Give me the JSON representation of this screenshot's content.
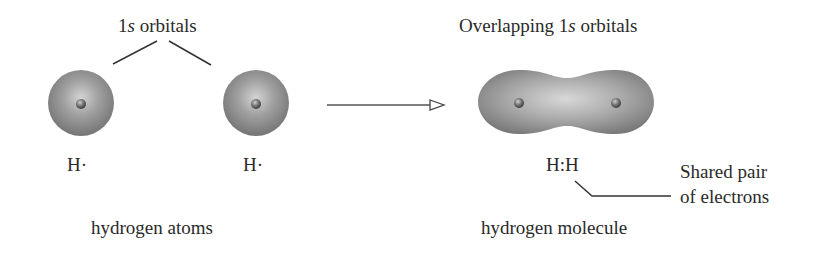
{
  "left_panel": {
    "orbital_label_prefix": "1",
    "orbital_label_italic": "s",
    "orbital_label_suffix": " orbitals",
    "atom_symbols": [
      "H·",
      "H·"
    ],
    "caption": "hydrogen atoms"
  },
  "right_panel": {
    "title_prefix": "Overlapping 1",
    "title_italic": "s",
    "title_suffix": " orbitals",
    "lewis_structure": "H:H",
    "annotation_line1": "Shared pair",
    "annotation_line2": "of electrons",
    "caption": "hydrogen molecule"
  },
  "colors": {
    "orbital_light": "#c8c8c8",
    "orbital_mid": "#8a8a8a",
    "orbital_dark": "#6e6e6e",
    "nucleus": "#5a5a5a",
    "line": "#333333"
  }
}
